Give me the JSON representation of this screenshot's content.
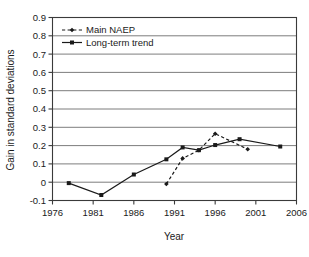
{
  "chart_data": {
    "type": "line",
    "title": "",
    "xlabel": "Year",
    "ylabel": "Gain in standard deviations",
    "xlim": [
      1976,
      2006
    ],
    "ylim": [
      -0.1,
      0.9
    ],
    "grid": true,
    "grid_axis": "y",
    "legend_position": "top-left-inside",
    "x_ticks": [
      1976,
      1981,
      1986,
      1991,
      1996,
      2001,
      2006
    ],
    "x_tick_labels": [
      "1976",
      "1981",
      "1986",
      "1991",
      "1996",
      "2001",
      "2006"
    ],
    "y_ticks": [
      -0.1,
      0,
      0.1,
      0.2,
      0.3,
      0.4,
      0.5,
      0.6,
      0.7,
      0.8,
      0.9
    ],
    "y_tick_labels": [
      "-0.1",
      "0",
      "0.1",
      "0.2",
      "0.3",
      "0.4",
      "0.5",
      "0.6",
      "0.7",
      "0.8",
      "0.9"
    ],
    "series": [
      {
        "name": "Main NAEP",
        "marker": "diamond",
        "linestyle": "dashed",
        "color": "#1a1a1a",
        "x": [
          1990,
          1992,
          1994,
          1996,
          2000
        ],
        "values": [
          -0.01,
          0.13,
          0.175,
          0.265,
          0.18
        ]
      },
      {
        "name": "Long-term trend",
        "marker": "square",
        "linestyle": "solid",
        "color": "#1a1a1a",
        "x": [
          1978,
          1982,
          1986,
          1990,
          1992,
          1994,
          1996,
          1999,
          2004
        ],
        "values": [
          -0.005,
          -0.07,
          0.042,
          0.125,
          0.19,
          0.175,
          0.203,
          0.235,
          0.195
        ]
      }
    ]
  },
  "legend": {
    "items": [
      {
        "label": "Main NAEP",
        "marker": "diamond",
        "linestyle": "dashed"
      },
      {
        "label": "Long-term trend",
        "marker": "square",
        "linestyle": "solid"
      }
    ]
  },
  "axes": {
    "x_title": "Year",
    "y_title": "Gain in standard deviations"
  }
}
